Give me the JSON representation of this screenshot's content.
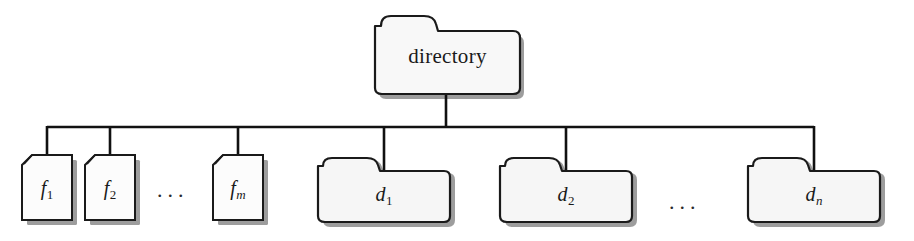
{
  "diagram": {
    "type": "tree",
    "canvas": {
      "width": 914,
      "height": 241,
      "background": "#ffffff"
    },
    "style": {
      "stroke": "#1a1a1a",
      "fill": "#f7f7f7",
      "shadow": "#9a9a9a",
      "connector": "#111111"
    },
    "root": {
      "label": "directory",
      "shape": "folder",
      "x": 375,
      "y": 14,
      "width": 145,
      "height": 81
    },
    "children": [
      {
        "id": "f1",
        "label": "f",
        "subscript": "1",
        "subscript_italic": false,
        "shape": "file",
        "x": 22,
        "y": 155,
        "width": 50,
        "height": 65
      },
      {
        "id": "f2",
        "label": "f",
        "subscript": "2",
        "subscript_italic": false,
        "shape": "file",
        "x": 85,
        "y": 155,
        "width": 50,
        "height": 65
      },
      {
        "id": "fm",
        "label": "f",
        "subscript": "m",
        "subscript_italic": true,
        "shape": "file",
        "x": 213,
        "y": 155,
        "width": 50,
        "height": 65
      },
      {
        "id": "d1",
        "label": "d",
        "subscript": "1",
        "subscript_italic": false,
        "shape": "folder",
        "x": 318,
        "y": 158,
        "width": 132,
        "height": 64
      },
      {
        "id": "d2",
        "label": "d",
        "subscript": "2",
        "subscript_italic": false,
        "shape": "folder",
        "x": 500,
        "y": 158,
        "width": 132,
        "height": 64
      },
      {
        "id": "dn",
        "label": "d",
        "subscript": "n",
        "subscript_italic": true,
        "shape": "folder",
        "x": 748,
        "y": 158,
        "width": 132,
        "height": 64
      }
    ],
    "ellipses": [
      {
        "id": "files-ellipsis",
        "text": "...",
        "x": 157,
        "y": 179
      },
      {
        "id": "folders-ellipsis",
        "text": "...",
        "x": 669,
        "y": 191
      }
    ],
    "connectors": {
      "root_stem_x": 446,
      "root_stem_top": 95,
      "bus_y": 127,
      "bus_x_start": 48,
      "bus_x_end": 814,
      "drops": [
        47,
        110,
        238,
        384,
        566,
        814
      ]
    }
  }
}
